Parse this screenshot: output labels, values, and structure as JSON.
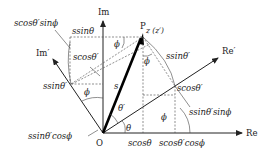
{
  "diagram": {
    "axes": {
      "re": "Re",
      "im": "Im",
      "re_prime": "Re′",
      "im_prime": "Im′"
    },
    "points": {
      "origin": "O",
      "p": "P",
      "p_coord": "z (z′)"
    },
    "vector_label": "s",
    "angles": {
      "theta": "θ",
      "theta_prime": "θ′",
      "phi_top": "ϕ",
      "phi_right": "ϕ",
      "phi_left": "ϕ",
      "phi_bottom": "ϕ"
    },
    "labels": {
      "s_cos_theta_p_sin_phi": "scosθ′sinϕ",
      "s_sin_theta_top": "ssinθ",
      "s_cos_theta_p_top": "scosθ′",
      "s_sin_theta_p_right": "ssinθ′",
      "s_sin_theta_p_left": "ssinθ′",
      "s_sin_theta_p_cos_phi": "ssinθ′cosϕ",
      "s_cos_theta_p_right": "scosθ′",
      "s_sin_theta_p_sin_phi": "ssinθ′sinϕ",
      "s_cos_theta": "scosθ",
      "s_cos_theta_p_cos_phi": "scosθ′cosϕ"
    }
  }
}
